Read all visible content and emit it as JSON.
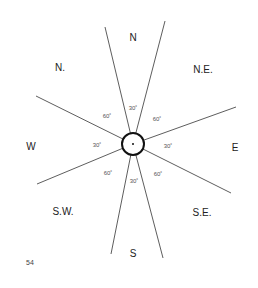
{
  "diagram": {
    "directions": {
      "n": "N",
      "nw": "N.",
      "ne": "N.E.",
      "w": "W",
      "e": "E",
      "sw": "S.W.",
      "se": "S.E.",
      "s": "S"
    },
    "angles": {
      "top": "30˚",
      "top_left": "60˚",
      "top_right": "60˚",
      "left": "30˚",
      "right": "30˚",
      "bottom_left": "60˚",
      "bottom_right": "60˚",
      "bottom": "30˚"
    },
    "page_number": "54"
  }
}
